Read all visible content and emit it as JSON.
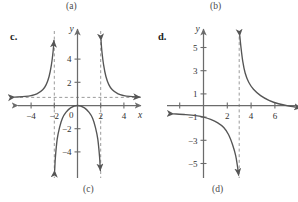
{
  "figure": {
    "captions": [
      {
        "id": "a",
        "text": "(a)"
      },
      {
        "id": "b",
        "text": "(b)"
      },
      {
        "id": "c",
        "text": "(c)"
      },
      {
        "id": "d",
        "text": "(d)"
      }
    ],
    "panel_labels": [
      {
        "id": "c",
        "text": "c."
      },
      {
        "id": "d",
        "text": "d."
      }
    ],
    "colors": {
      "axis": "#6b6b6b",
      "curve": "#555555",
      "asymptote": "#9a9a9a",
      "text": "#333333",
      "background": "#ffffff"
    }
  },
  "chart_data": [
    {
      "id": "c",
      "type": "line",
      "title": "c.",
      "caption": "(c)",
      "xlabel": "x",
      "ylabel": "y",
      "xlim": [
        -5.6,
        5.6
      ],
      "ylim": [
        -6.0,
        5.8
      ],
      "grid": false,
      "legend": "none",
      "xticks": [
        -4,
        -2,
        2,
        4
      ],
      "xticklabels": [
        "-4",
        "-2",
        "2",
        "4"
      ],
      "yticks": [
        -4,
        -2,
        2,
        4
      ],
      "yticklabels": [
        "-4",
        "-2",
        "2",
        "4"
      ],
      "origin_label": "0",
      "asymptotes": {
        "vertical": [
          -2,
          2
        ],
        "horizontal": [
          0.7
        ]
      },
      "branches": [
        {
          "name": "left-branch",
          "description": "rises from horizontal asymptote y=0.7 on the far left up to +infinity at x=-2",
          "x": [
            -5.4,
            -4.5,
            -4.0,
            -3.5,
            -3.0,
            -2.7,
            -2.45,
            -2.25,
            -2.1,
            -2.03
          ],
          "y": [
            0.72,
            0.78,
            0.85,
            1.0,
            1.35,
            1.8,
            2.5,
            3.5,
            4.7,
            5.6
          ]
        },
        {
          "name": "middle-branch",
          "description": "downward arch with maximum at the origin (0,0), falling to -infinity at x=-2 and x=2",
          "x": [
            -1.97,
            -1.9,
            -1.75,
            -1.55,
            -1.3,
            -1.0,
            -0.6,
            0.0,
            0.6,
            1.0,
            1.3,
            1.55,
            1.75,
            1.9,
            1.97
          ],
          "y": [
            -5.6,
            -4.4,
            -2.9,
            -1.9,
            -1.1,
            -0.6,
            -0.2,
            0.0,
            -0.2,
            -0.6,
            -1.1,
            -1.9,
            -2.9,
            -4.4,
            -5.6
          ]
        },
        {
          "name": "right-branch",
          "description": "falls from +infinity at x=2 toward horizontal asymptote y=0.7 on the far right",
          "x": [
            2.03,
            2.1,
            2.25,
            2.45,
            2.7,
            3.0,
            3.5,
            4.0,
            4.5,
            5.4
          ],
          "y": [
            5.6,
            4.7,
            3.5,
            2.5,
            1.8,
            1.35,
            1.0,
            0.85,
            0.78,
            0.72
          ]
        }
      ]
    },
    {
      "id": "d",
      "type": "line",
      "title": "d.",
      "caption": "(d)",
      "xlabel": "",
      "ylabel": "y",
      "xlim": [
        -2.6,
        8.4
      ],
      "ylim": [
        -6.4,
        6.2
      ],
      "grid": false,
      "legend": "none",
      "xticks": [
        -2,
        2,
        4,
        6
      ],
      "xticklabels": [
        "",
        "2",
        "4",
        "6"
      ],
      "yticks": [
        -5,
        -3,
        -1,
        1,
        3,
        5
      ],
      "yticklabels": [
        "-5",
        "-3",
        "-1",
        "1",
        "3",
        "5"
      ],
      "asymptotes": {
        "vertical": [
          3
        ],
        "horizontal": [
          -0.7
        ]
      },
      "branches": [
        {
          "name": "left-branch",
          "description": "comes in along horizontal asymptote y=-0.7 from the far left, crosses near x=0 and plunges to -infinity at x=3",
          "x": [
            -2.5,
            -1.5,
            -0.5,
            0.0,
            0.6,
            1.2,
            1.7,
            2.1,
            2.45,
            2.7,
            2.85,
            2.95
          ],
          "y": [
            -0.72,
            -0.78,
            -0.9,
            -1.0,
            -1.2,
            -1.5,
            -1.9,
            -2.5,
            -3.4,
            -4.3,
            -5.2,
            -6.0
          ]
        },
        {
          "name": "right-branch",
          "description": "descends from +infinity at x=3 toward horizontal asymptote y=-0.7 far to the right",
          "x": [
            3.05,
            3.15,
            3.3,
            3.5,
            3.8,
            4.2,
            4.8,
            5.5,
            6.3,
            7.2,
            8.2
          ],
          "y": [
            6.0,
            5.0,
            3.8,
            2.8,
            2.0,
            1.4,
            0.85,
            0.45,
            0.15,
            -0.05,
            -0.2
          ]
        }
      ]
    }
  ]
}
